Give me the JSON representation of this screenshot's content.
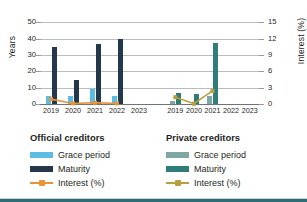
{
  "chart_data": {
    "type": "bar",
    "title": "",
    "ylabel": "Years",
    "ylabel_secondary": "Interest (%)",
    "xlabel": "",
    "ylim": [
      0,
      55
    ],
    "ylim_secondary": [
      0,
      16.5
    ],
    "yticks": [
      0,
      10,
      20,
      30,
      40,
      50
    ],
    "yticks_secondary": [
      0,
      3,
      6,
      9,
      12,
      15
    ],
    "grid": true,
    "legend_position": "bottom",
    "categories": [
      "2019",
      "2020",
      "2021",
      "2022",
      "2023"
    ],
    "panels": [
      {
        "name": "Official creditors",
        "label": "Official creditors",
        "categories": [
          "2019",
          "2020",
          "2021",
          "2022",
          "2023"
        ],
        "series": [
          {
            "name": "Grace period",
            "type": "bar",
            "axis": "left",
            "color": "#5BBCE4",
            "values": [
              5,
              5,
              9,
              5,
              null
            ]
          },
          {
            "name": "Maturity",
            "type": "bar",
            "axis": "left",
            "color": "#23384C",
            "values": [
              35,
              14.5,
              36.5,
              40,
              null
            ]
          },
          {
            "name": "Interest (%)",
            "type": "line",
            "axis": "right",
            "color": "#E8953A",
            "values": [
              0.9,
              0.1,
              0.25,
              0.1,
              null
            ]
          }
        ]
      },
      {
        "name": "Private creditors",
        "label": "Private creditors",
        "categories": [
          "2019",
          "2020",
          "2021",
          "2022",
          "2023"
        ],
        "series": [
          {
            "name": "Grace period",
            "type": "bar",
            "axis": "left",
            "color": "#7FA8A4",
            "values": [
              1.7,
              0,
              4.8,
              null,
              null
            ]
          },
          {
            "name": "Maturity",
            "type": "bar",
            "axis": "left",
            "color": "#2E7D78",
            "values": [
              6.6,
              5.9,
              37.3,
              null,
              null
            ]
          },
          {
            "name": "Interest (%)",
            "type": "line",
            "axis": "right",
            "color": "#B8A03C",
            "values": [
              1.25,
              0.05,
              2.4,
              null,
              null
            ]
          }
        ]
      }
    ]
  },
  "axes": {
    "left_title": "Years",
    "right_title": "Interest (%)",
    "left_ticks": [
      "50",
      "40",
      "30",
      "20",
      "10",
      "0"
    ],
    "right_ticks": [
      "15",
      "12",
      "9",
      "6",
      "3",
      "0"
    ]
  },
  "panel_left": {
    "title": "Official creditors",
    "xlabels": [
      "2019",
      "2020",
      "2021",
      "2022",
      "2023"
    ]
  },
  "panel_right": {
    "title": "Private creditors",
    "xlabels": [
      "2019",
      "2020",
      "2021",
      "2022",
      "2023"
    ]
  },
  "legend_left": {
    "title": "Official creditors",
    "items": [
      {
        "label": "Grace period",
        "color": "#5BBCE4",
        "marker": "bar"
      },
      {
        "label": "Maturity",
        "color": "#23384C",
        "marker": "bar"
      },
      {
        "label": "Interest (%)",
        "color": "#E8953A",
        "marker": "line"
      }
    ]
  },
  "legend_right": {
    "title": "Private creditors",
    "items": [
      {
        "label": "Grace period",
        "color": "#7FA8A4",
        "marker": "bar"
      },
      {
        "label": "Maturity",
        "color": "#2E7D78",
        "marker": "bar"
      },
      {
        "label": "Interest (%)",
        "color": "#B8A03C",
        "marker": "line"
      }
    ]
  },
  "colors": {
    "grid": "#b9bdc0",
    "axis": "#6f7478",
    "text": "#231f20",
    "footer_rule": "#2e6b72"
  }
}
